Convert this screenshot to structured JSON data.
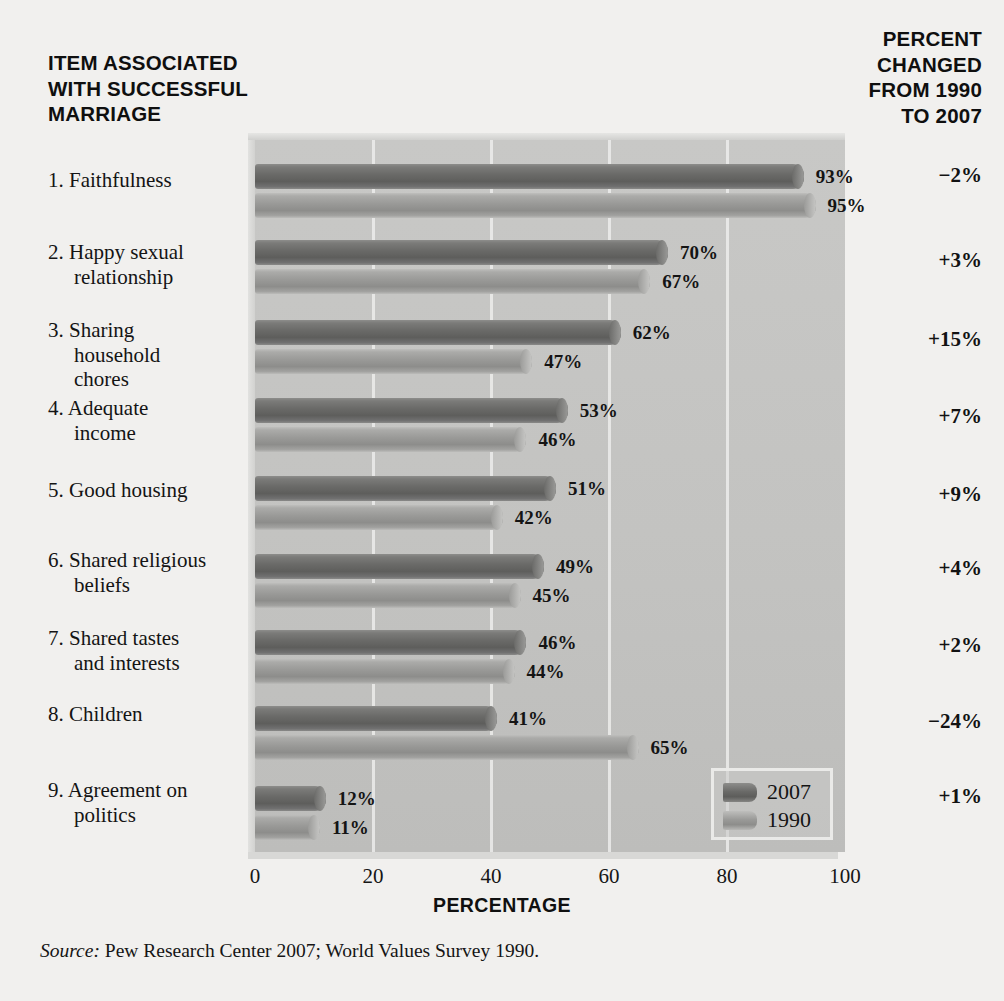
{
  "headers": {
    "left": [
      "ITEM ASSOCIATED",
      "WITH SUCCESSFUL",
      "MARRIAGE"
    ],
    "right": [
      "PERCENT",
      "CHANGED",
      "FROM 1990",
      "TO 2007"
    ]
  },
  "axis_title": "PERCENTAGE",
  "source_prefix": "Source:",
  "source_text": " Pew Research Center 2007; World Values Survey 1990.",
  "legend": {
    "items": [
      {
        "label": "2007"
      },
      {
        "label": "1990"
      }
    ]
  },
  "colors": {
    "series_2007": "#6a6a68",
    "series_1990": "#9a9a98",
    "plot_bg": "#c4c4c2",
    "page_bg": "#f1f0ee",
    "gridline": "#ececea"
  },
  "chart_data": {
    "type": "bar",
    "orientation": "horizontal",
    "xlabel": "PERCENTAGE",
    "ylabel": "",
    "xlim": [
      0,
      100
    ],
    "xticks": [
      "0",
      "20",
      "40",
      "60",
      "80",
      "100"
    ],
    "grid": true,
    "legend_position": "bottom-right",
    "categories": [
      "1. Faithfulness",
      "2. Happy sexual relationship",
      "3. Sharing household chores",
      "4. Adequate income",
      "5. Good housing",
      "6. Shared religious beliefs",
      "7. Shared tastes and interests",
      "8. Children",
      "9. Agreement on politics"
    ],
    "series": [
      {
        "name": "2007",
        "values": [
          93,
          70,
          62,
          53,
          51,
          49,
          46,
          41,
          12
        ],
        "labels": [
          "93%",
          "70%",
          "62%",
          "53%",
          "51%",
          "49%",
          "46%",
          "41%",
          "12%"
        ]
      },
      {
        "name": "1990",
        "values": [
          95,
          67,
          47,
          46,
          42,
          45,
          44,
          65,
          11
        ],
        "labels": [
          "95%",
          "67%",
          "47%",
          "46%",
          "42%",
          "45%",
          "44%",
          "65%",
          "11%"
        ]
      }
    ],
    "annotations": {
      "column_header": "PERCENT CHANGED FROM 1990 TO 2007",
      "values": [
        "−2%",
        "+3%",
        "+15%",
        "+7%",
        "+9%",
        "+4%",
        "+2%",
        "−24%",
        "+1%"
      ]
    }
  },
  "rows": [
    {
      "num": "1.",
      "name": "Faithfulness",
      "lines": [
        "1. Faithfulness"
      ],
      "change": "−2%",
      "v2007": 93,
      "v1990": 95,
      "l2007": "93%",
      "l1990": "95%"
    },
    {
      "num": "2.",
      "name": "Happy sexual relationship",
      "lines": [
        "2. Happy sexual",
        "relationship"
      ],
      "change": "+3%",
      "v2007": 70,
      "v1990": 67,
      "l2007": "70%",
      "l1990": "67%"
    },
    {
      "num": "3.",
      "name": "Sharing household chores",
      "lines": [
        "3. Sharing",
        "household",
        "chores"
      ],
      "change": "+15%",
      "v2007": 62,
      "v1990": 47,
      "l2007": "62%",
      "l1990": "47%"
    },
    {
      "num": "4.",
      "name": "Adequate income",
      "lines": [
        "4. Adequate",
        "income"
      ],
      "change": "+7%",
      "v2007": 53,
      "v1990": 46,
      "l2007": "53%",
      "l1990": "46%"
    },
    {
      "num": "5.",
      "name": "Good housing",
      "lines": [
        "5. Good housing"
      ],
      "change": "+9%",
      "v2007": 51,
      "v1990": 42,
      "l2007": "51%",
      "l1990": "42%"
    },
    {
      "num": "6.",
      "name": "Shared religious beliefs",
      "lines": [
        "6. Shared religious",
        "beliefs"
      ],
      "change": "+4%",
      "v2007": 49,
      "v1990": 45,
      "l2007": "49%",
      "l1990": "45%"
    },
    {
      "num": "7.",
      "name": "Shared tastes and interests",
      "lines": [
        "7. Shared tastes",
        "and interests"
      ],
      "change": "+2%",
      "v2007": 46,
      "v1990": 44,
      "l2007": "46%",
      "l1990": "44%"
    },
    {
      "num": "8.",
      "name": "Children",
      "lines": [
        "8. Children"
      ],
      "change": "−24%",
      "v2007": 41,
      "v1990": 65,
      "l2007": "41%",
      "l1990": "65%"
    },
    {
      "num": "9.",
      "name": "Agreement on politics",
      "lines": [
        "9. Agreement on",
        "politics"
      ],
      "change": "+1%",
      "v2007": 12,
      "v1990": 11,
      "l2007": "12%",
      "l1990": "11%"
    }
  ]
}
